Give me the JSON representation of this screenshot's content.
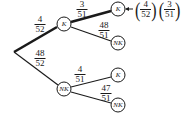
{
  "diagram": {
    "type": "probability-tree",
    "root": {
      "x": 14,
      "y": 52
    },
    "nodes": [
      {
        "id": "k1",
        "label": "K",
        "x": 64,
        "y": 24
      },
      {
        "id": "nk1",
        "label": "NK",
        "x": 64,
        "y": 89
      },
      {
        "id": "kk",
        "label": "K",
        "x": 118,
        "y": 9
      },
      {
        "id": "knk",
        "label": "NK",
        "x": 118,
        "y": 43
      },
      {
        "id": "nkk",
        "label": "K",
        "x": 118,
        "y": 75
      },
      {
        "id": "nknk",
        "label": "NK",
        "x": 118,
        "y": 105
      }
    ],
    "edges": [
      {
        "from": "root",
        "to": "k1",
        "prob": {
          "num": "4",
          "den": "52"
        },
        "highlight": true
      },
      {
        "from": "root",
        "to": "nk1",
        "prob": {
          "num": "48",
          "den": "52"
        },
        "highlight": false
      },
      {
        "from": "k1",
        "to": "kk",
        "prob": {
          "num": "3",
          "den": "51"
        },
        "highlight": true
      },
      {
        "from": "k1",
        "to": "knk",
        "prob": {
          "num": "48",
          "den": "51"
        },
        "highlight": false
      },
      {
        "from": "nk1",
        "to": "nkk",
        "prob": {
          "num": "4",
          "den": "51"
        },
        "highlight": false
      },
      {
        "from": "nk1",
        "to": "nknk",
        "prob": {
          "num": "47",
          "den": "51"
        },
        "highlight": false
      }
    ],
    "result": {
      "target": "kk",
      "factors": [
        {
          "num": "4",
          "den": "52"
        },
        {
          "num": "3",
          "den": "51"
        }
      ]
    }
  }
}
